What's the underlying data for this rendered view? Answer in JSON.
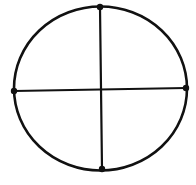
{
  "diagram": {
    "colors": {
      "stroke": "#111111",
      "background": "#ffffff"
    },
    "circle": {
      "cx": 100.5,
      "cy": 88.5,
      "rx": 86.5,
      "ry": 82,
      "stroke_width": 2.6
    },
    "lines": [
      {
        "name": "vertical-diameter",
        "x1": 100,
        "y1": 7,
        "x2": 102,
        "y2": 169
      },
      {
        "name": "horizontal-diameter",
        "x1": 14,
        "y1": 91,
        "x2": 186,
        "y2": 88
      }
    ],
    "points": [
      {
        "name": "top-point",
        "x": 100,
        "y": 7
      },
      {
        "name": "left-point",
        "x": 14,
        "y": 91
      },
      {
        "name": "right-point",
        "x": 186,
        "y": 88
      },
      {
        "name": "bottom-point",
        "x": 102,
        "y": 169
      }
    ]
  }
}
